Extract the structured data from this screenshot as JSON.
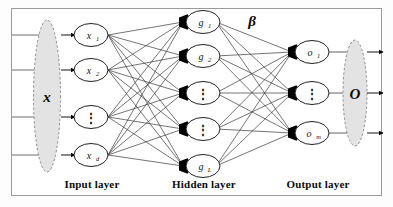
{
  "figure": {
    "frame_color": "#9a9a9a",
    "background": "#ffffff",
    "line_color": "#2b2b2b",
    "marker_color": "#000000",
    "bundle_fill": "#e3e3e3"
  },
  "captions": {
    "input": "Input layer",
    "hidden": "Hidden layer",
    "output": "Output layer"
  },
  "bundles": {
    "input_vector": "x",
    "output_vector": "O"
  },
  "weights": {
    "beta": "β"
  },
  "layers": {
    "input": {
      "name": "Input layer",
      "nodes": [
        {
          "base": "x",
          "sub": "1",
          "dots": false
        },
        {
          "base": "x",
          "sub": "2",
          "dots": false
        },
        {
          "base": "",
          "sub": "",
          "dots": true
        },
        {
          "base": "x",
          "sub": "d",
          "dots": false
        }
      ]
    },
    "hidden": {
      "name": "Hidden layer",
      "nodes": [
        {
          "base": "g",
          "sub": "1",
          "dots": false
        },
        {
          "base": "g",
          "sub": "2",
          "dots": false
        },
        {
          "base": "",
          "sub": "",
          "dots": true
        },
        {
          "base": "",
          "sub": "",
          "dots": true
        },
        {
          "base": "g",
          "sub": "L",
          "dots": false
        }
      ]
    },
    "output": {
      "name": "Output layer",
      "nodes": [
        {
          "base": "o",
          "sub": "1",
          "dots": false
        },
        {
          "base": "",
          "sub": "",
          "dots": true
        },
        {
          "base": "o",
          "sub": "m",
          "dots": false
        }
      ]
    }
  },
  "dots_glyph": "⋮",
  "external_arrows": {
    "inbound_count": 4,
    "outbound_count": 3
  }
}
